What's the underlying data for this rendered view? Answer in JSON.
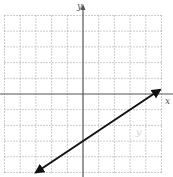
{
  "chart_data": {
    "type": "line",
    "title": "",
    "xlabel": "x",
    "ylabel": "y",
    "xlim": [
      -5,
      5
    ],
    "ylim": [
      -5,
      5
    ],
    "grid": true,
    "grid_style": "dotted",
    "tick_labels_shown": false,
    "series": [
      {
        "name": "line",
        "equation": "y = (2/3)x - 3",
        "slope": 0.6667,
        "intercept": -3,
        "x": [
          -3,
          4.9
        ],
        "y": [
          -5,
          0.27
        ],
        "arrows": "both"
      }
    ],
    "annotations": [
      {
        "text": "y",
        "x": 3.5,
        "y": -2.6,
        "style": "faint"
      }
    ]
  },
  "labels": {
    "x_axis": "x",
    "y_axis": "y",
    "faint_mark": "y"
  },
  "colors": {
    "grid": "#9a9a9a",
    "axis": "#555555",
    "line": "#111111"
  }
}
